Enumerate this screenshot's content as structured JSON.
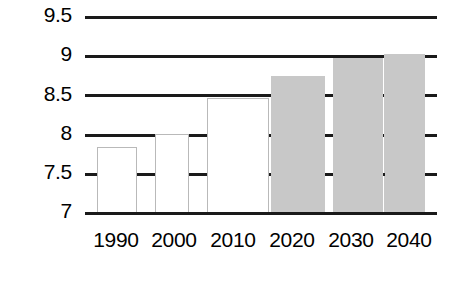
{
  "chart_data": {
    "type": "bar",
    "title": "",
    "subtitle": "",
    "xlabel": "",
    "ylabel": "",
    "categories": [
      "1990",
      "2000",
      "2010",
      "2020",
      "2030",
      "2040"
    ],
    "values": [
      7.83,
      8.0,
      8.45,
      8.74,
      8.97,
      9.02
    ],
    "series": [
      {
        "name": "",
        "values": [
          7.83,
          8.0,
          8.45,
          8.74,
          8.97,
          9.02
        ]
      }
    ],
    "ylim": [
      7,
      9.5
    ],
    "yticks": [
      7,
      7.5,
      8,
      8.5,
      9,
      9.5
    ],
    "ytick_labels": [
      "7",
      "7.5",
      "8",
      "8.5",
      "9",
      "9.5"
    ],
    "xtick_labels": [
      "1990",
      "2000",
      "2010",
      "2020",
      "2030",
      "2040"
    ],
    "grid": true,
    "grid_axis": "y",
    "legend": false,
    "legend_position": "none",
    "bar_styles": [
      "open",
      "open",
      "open",
      "filled",
      "filled",
      "filled"
    ],
    "colors": {
      "bar_fill_projected": "#c8c8c8",
      "bar_fill_historic": "#ffffff",
      "bar_outline_historic": "#b9b9b9",
      "gridline": "#1a1a1a",
      "axis": "#1a1a1a",
      "text": "#000000",
      "background": "#ffffff"
    }
  }
}
